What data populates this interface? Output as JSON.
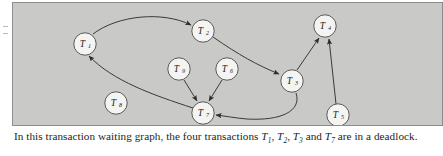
{
  "figure": {
    "panel_background": "#c9c9c7",
    "node_fill": "#f4f4f2",
    "stroke_color": "#3a3a38"
  },
  "graph_data": {
    "type": "directed-graph",
    "title": "transaction waiting graph",
    "nodes": [
      {
        "id": "T1",
        "base": "T",
        "sub": "1",
        "x": 72,
        "y": 41
      },
      {
        "id": "T2",
        "base": "T",
        "sub": "2",
        "x": 190,
        "y": 28
      },
      {
        "id": "T3",
        "base": "T",
        "sub": "3",
        "x": 279,
        "y": 78
      },
      {
        "id": "T4",
        "base": "T",
        "sub": "4",
        "x": 312,
        "y": 23
      },
      {
        "id": "T5",
        "base": "T",
        "sub": "5",
        "x": 325,
        "y": 112
      },
      {
        "id": "T6",
        "base": "T",
        "sub": "6",
        "x": 214,
        "y": 66
      },
      {
        "id": "T7",
        "base": "T",
        "sub": "7",
        "x": 190,
        "y": 110
      },
      {
        "id": "T8",
        "base": "T",
        "sub": "8",
        "x": 103,
        "y": 100
      },
      {
        "id": "T9",
        "base": "T",
        "sub": "9",
        "x": 166,
        "y": 66
      }
    ],
    "edges": [
      {
        "from": "T1",
        "to": "T2"
      },
      {
        "from": "T2",
        "to": "T3"
      },
      {
        "from": "T3",
        "to": "T7"
      },
      {
        "from": "T7",
        "to": "T1"
      },
      {
        "from": "T3",
        "to": "T4"
      },
      {
        "from": "T5",
        "to": "T4"
      },
      {
        "from": "T9",
        "to": "T7"
      },
      {
        "from": "T6",
        "to": "T7"
      }
    ],
    "deadlock_cycle": [
      "T1",
      "T2",
      "T3",
      "T7"
    ],
    "isolated_nodes": [
      "T8"
    ]
  },
  "caption": {
    "part1": "In this transaction waiting graph, the four transactions ",
    "t1": "T",
    "t1sub": "1",
    "sep1": ", ",
    "t2": "T",
    "t2sub": "2",
    "sep2": ", ",
    "t3": "T",
    "t3sub": "3",
    "sep3": " and ",
    "t7": "T",
    "t7sub": "7",
    "part2": " are in a deadlock."
  }
}
